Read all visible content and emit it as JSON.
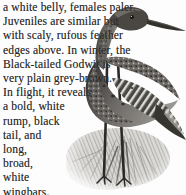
{
  "document": {
    "kind": "field-guide-page",
    "species": "Black-tailed Godwit",
    "background_color": "#fdfdfd",
    "text_color": "#2b2b2b"
  },
  "caption": {
    "full_text": "a white belly, females paler. Juveniles are similar but with scaly, rufous feather edges above. In winter, the Black-tailed Godwit is very plain grey-brown. In flight, it reveals a bold, white rump, black tail, and long, broad, white wingbars.",
    "lines": [
      "a white belly, females paler.",
      "Juveniles are similar but",
      "with scaly, rufous feather",
      "edges above. In winter, the",
      "Black-tailed Godwit is",
      "very plain grey-brown.",
      "In flight, it reveals",
      "a bold, white",
      "rump, black",
      "tail, and",
      "long,",
      "broad,",
      "white",
      "wingbars."
    ]
  },
  "illustration": {
    "subject": "black-tailed-godwit-standing",
    "style": "grayscale-halftone-photo",
    "description": "Grayscale photograph of a Black-tailed Godwit standing on tufted vegetation, long straight bill pointing right, mottled and barred plumage, two long dark legs.",
    "palette": {
      "plumage_dark": "#3a3a3a",
      "plumage_mid": "#6e6e6e",
      "plumage_light": "#b3b3b3",
      "vegetation": "#c9c9c9",
      "background": "#fdfdfd"
    }
  }
}
